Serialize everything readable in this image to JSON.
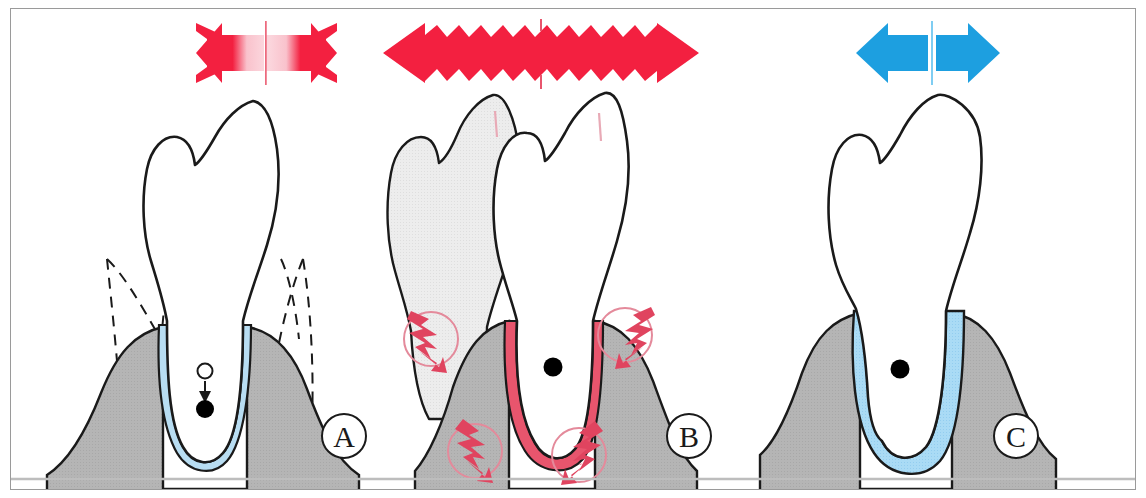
{
  "figure": {
    "title": "Periodontal ligament response to occlusal force — three stages",
    "background_color": "#ffffff",
    "border_color": "#9a9a9a",
    "width": 1146,
    "height": 498
  },
  "colors": {
    "bone_gray": "#b5b5b5",
    "bone_outline": "#1a1a1a",
    "tooth_outline": "#1a1a1a",
    "tooth_fill": "#ffffff",
    "ghost_tooth_fill": "#ededed",
    "ligament_blue": "#b8ddf2",
    "ligament_blue_wide": "#aadbf5",
    "ligament_red": "#e8556d",
    "arrow_red": "#f32040",
    "arrow_red_pale": "#f6b8c2",
    "arrow_blue": "#1d9fe0",
    "bolt_red": "#e0445f",
    "circle_red": "#e48a9b",
    "dot_black": "#000000",
    "baseline_gray": "#bdbdbd"
  },
  "panels": [
    {
      "id": "A",
      "label": "A",
      "name": "panel-a-normal-occlusal-force",
      "description": "Normal tooth with narrow blue periodontal ligament; dashed outline shows original bone/tooth position; black dot with arrow indicates apical displacement under force.",
      "force_arrow": {
        "name": "force-arrow-gradient-red",
        "type": "double-headed",
        "style": "gradient-faded-center",
        "color": "#f32040",
        "pale_color": "#f6b8c2",
        "edge": "smooth"
      },
      "markers": {
        "center_dot": true,
        "displacement_arrow": true,
        "hollow_origin_circle": true,
        "dashed_outline": true,
        "ligament_state": "normal-narrow",
        "ligament_color": "#b8ddf2"
      }
    },
    {
      "id": "B",
      "label": "B",
      "name": "panel-b-excessive-force-trauma",
      "description": "Tooth displaced from its original position (ghost outline shaded gray); periodontal ligament inflamed and red with compression hatching; four lightning-bolt pain markers in circles at pressure zones.",
      "force_arrow": {
        "name": "force-arrow-jagged-red",
        "type": "double-headed",
        "style": "solid-zigzag",
        "color": "#f32040",
        "edge": "sawtooth"
      },
      "markers": {
        "center_dot": true,
        "ghost_tooth": true,
        "ligament_state": "inflamed-red-compressed",
        "ligament_color": "#e8556d",
        "pain_bolts": 4,
        "bolt_color": "#e0445f",
        "bolt_circle_color": "#e48a9b"
      }
    },
    {
      "id": "C",
      "label": "C",
      "name": "panel-c-adapted-widened-ligament",
      "description": "Tooth with widened blue periodontal ligament space after adaptation; blue double arrow indicates tolerated force.",
      "force_arrow": {
        "name": "force-arrow-solid-blue",
        "type": "double-headed",
        "style": "solid-split",
        "color": "#1d9fe0",
        "edge": "smooth"
      },
      "markers": {
        "center_dot": true,
        "ligament_state": "widened-blue",
        "ligament_color": "#aadbf5",
        "dashed_outline": false
      }
    }
  ]
}
